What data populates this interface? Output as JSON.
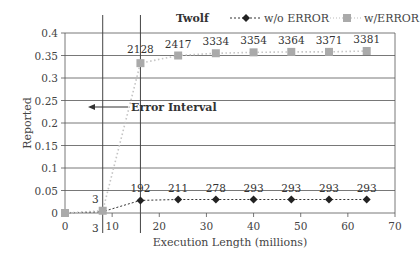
{
  "chart_data": {
    "type": "line",
    "title": "Twolf",
    "xlabel": "Execution Length (millions)",
    "ylabel": "Reported",
    "xlim": [
      0,
      70
    ],
    "ylim": [
      0,
      0.4
    ],
    "x_ticks": [
      0,
      10,
      20,
      30,
      40,
      50,
      60,
      70
    ],
    "y_ticks": [
      0,
      0.05,
      0.1,
      0.15,
      0.2,
      0.25,
      0.3,
      0.35,
      0.4
    ],
    "y_tick_labels": [
      "0",
      "0.05",
      "0.1",
      "0.15",
      "0.2",
      "0.25",
      "0.3",
      "0.35",
      "0.4"
    ],
    "grid": "horizontal",
    "legend_position": "top-right",
    "x": [
      0,
      8,
      16,
      24,
      32,
      40,
      48,
      56,
      64
    ],
    "series": [
      {
        "name": "w/o ERROR",
        "marker": "diamond",
        "color": "#222222",
        "line_style": "dashed",
        "values": [
          0,
          0.003,
          0.028,
          0.03,
          0.03,
          0.03,
          0.03,
          0.03,
          0.03
        ],
        "labels": [
          "",
          "3",
          "192",
          "211",
          "278",
          "293",
          "293",
          "293",
          "293"
        ]
      },
      {
        "name": "w/ERROR",
        "marker": "square",
        "color": "#aaaaaa",
        "line_style": "dotted",
        "values": [
          0,
          0.005,
          0.333,
          0.35,
          0.355,
          0.357,
          0.358,
          0.358,
          0.36
        ],
        "labels": [
          "",
          "3",
          "2128",
          "2417",
          "3334",
          "3354",
          "3364",
          "3371",
          "3381"
        ]
      }
    ],
    "annotations": [
      {
        "text": "Error Interval",
        "type": "arrow-left",
        "x_range": [
          8,
          16
        ]
      }
    ],
    "vertical_lines": [
      8,
      16
    ]
  }
}
